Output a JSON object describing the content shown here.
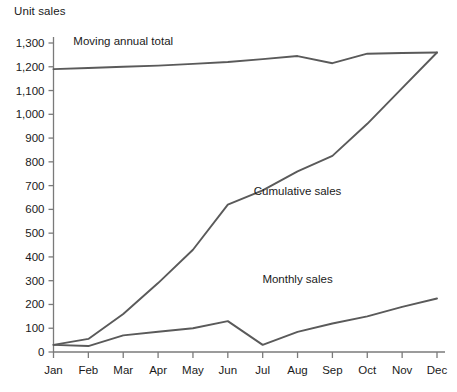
{
  "chart_data": {
    "type": "line",
    "title": "Unit sales",
    "xlabel": "",
    "ylabel": "Unit sales",
    "categories": [
      "Jan",
      "Feb",
      "Mar",
      "Apr",
      "May",
      "Jun",
      "Jul",
      "Aug",
      "Sep",
      "Oct",
      "Nov",
      "Dec"
    ],
    "ylim": [
      0,
      1300
    ],
    "ytick_step": 100,
    "yticks": [
      "0",
      "100",
      "200",
      "300",
      "400",
      "500",
      "600",
      "700",
      "800",
      "900",
      "1,000",
      "1,100",
      "1,200",
      "1,300"
    ],
    "grid": false,
    "legend": "inline-annotations",
    "series": [
      {
        "name": "Moving annual total",
        "values": [
          1190,
          1195,
          1200,
          1205,
          1212,
          1220,
          1232,
          1245,
          1215,
          1255,
          1258,
          1260
        ],
        "label_x_category": "Mar",
        "label_value": 1290
      },
      {
        "name": "Cumulative sales",
        "values": [
          30,
          55,
          160,
          290,
          430,
          620,
          680,
          760,
          825,
          960,
          1110,
          1260
        ],
        "label_x_category": "Aug",
        "label_value": 660
      },
      {
        "name": "Monthly sales",
        "values": [
          30,
          25,
          70,
          85,
          100,
          130,
          30,
          85,
          120,
          150,
          190,
          225
        ],
        "label_x_category": "Aug",
        "label_value": 290
      }
    ],
    "annotations": [
      {
        "text": "Moving annual total",
        "series": "Moving annual total"
      },
      {
        "text": "Cumulative sales",
        "series": "Cumulative sales"
      },
      {
        "text": "Monthly sales",
        "series": "Monthly sales"
      }
    ],
    "colors": {
      "line": "#5a5a5a",
      "axis": "#7a7a7a",
      "text": "#1a1a1a",
      "background": "#ffffff"
    }
  }
}
